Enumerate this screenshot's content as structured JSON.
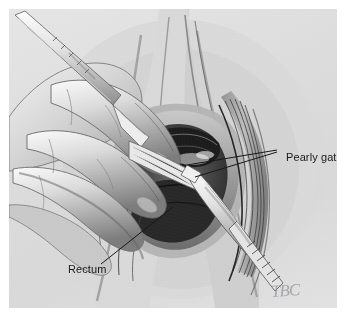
{
  "figure": {
    "kind": "medical-illustration",
    "medium": "graphite pencil drawing",
    "panel_background": "#dedede",
    "ink_color": "#17181a"
  },
  "annotations": [
    {
      "id": "pearly-gates",
      "label": "Pearly gates",
      "leader_count": 2,
      "text_anchor": "left",
      "text_x": 277,
      "text_y": 142
    },
    {
      "id": "rectum",
      "label": "Rectum",
      "leader_count": 1,
      "text_anchor": "left",
      "text_x": 59,
      "text_y": 254
    }
  ],
  "signature": {
    "monogram": "TBC"
  },
  "instruments": [
    {
      "name": "scalpel",
      "position": "upper-left",
      "label": "scalpel"
    },
    {
      "name": "forceps",
      "position": "lower-right",
      "label": "forceps"
    },
    {
      "name": "retractor",
      "position": "center",
      "label": "retractor"
    }
  ],
  "anatomy": [
    {
      "name": "gloved-hand",
      "label": "gloved hand"
    },
    {
      "name": "rectum-tissue",
      "label": "rectum"
    },
    {
      "name": "pearly-gates-tissue",
      "label": "pearly gates"
    },
    {
      "name": "fascia-striations",
      "label": "fascia"
    }
  ]
}
